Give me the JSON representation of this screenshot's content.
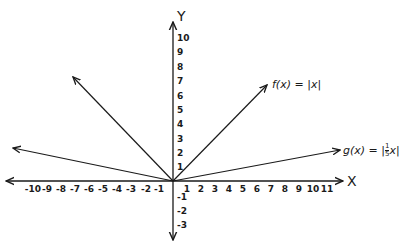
{
  "figure": {
    "type": "graph",
    "x_axis_label": "X",
    "y_axis_label": "Y",
    "x_ticks": [
      "-10",
      "-9",
      "-8",
      "-7",
      "-6",
      "-5",
      "-4",
      "-3",
      "-2",
      "-1",
      "1",
      "2",
      "3",
      "4",
      "5",
      "6",
      "7",
      "8",
      "9",
      "10",
      "11"
    ],
    "y_ticks": [
      "10",
      "9",
      "8",
      "7",
      "6",
      "5",
      "4",
      "3",
      "2",
      "1",
      "-1",
      "-2",
      "-3"
    ],
    "functions": [
      {
        "name": "f",
        "label": "f(x) = |x|",
        "formula": "|x|"
      },
      {
        "name": "g",
        "label": "g(x) = |1/5 x|",
        "formula": "|x/5|"
      }
    ],
    "colors": {
      "ink": "#1a1a1a",
      "background": "#ffffff"
    }
  },
  "labels": {
    "f": "f(x) = |x|",
    "g_prefix": "g(x) = |",
    "g_num": "1",
    "g_den": "5",
    "g_suffix": "x|",
    "x_axis": "X",
    "y_axis": "Y"
  }
}
